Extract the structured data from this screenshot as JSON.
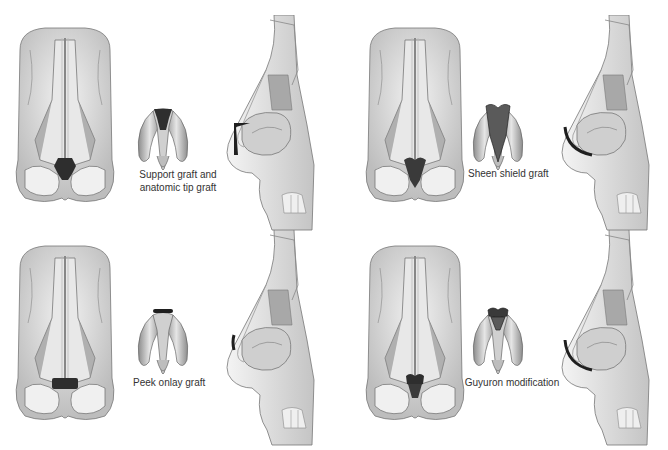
{
  "figure": {
    "panels": [
      {
        "id": "a",
        "label": "Support graft and anatomic tip graft",
        "label_line1": "Support graft and",
        "label_line2": "anatomic tip graft"
      },
      {
        "id": "b",
        "label": "Sheen shield graft"
      },
      {
        "id": "c",
        "label": "Peek onlay graft"
      },
      {
        "id": "d",
        "label": "Guyuron modification"
      }
    ],
    "colors": {
      "background": "#ffffff",
      "bone": "#d9d9d9",
      "bone_dark": "#9a9a9a",
      "cartilage": "#c8c8c8",
      "graft": "#2e2e2e",
      "graft_mid": "#5a5a5a",
      "outline": "#555555"
    }
  }
}
